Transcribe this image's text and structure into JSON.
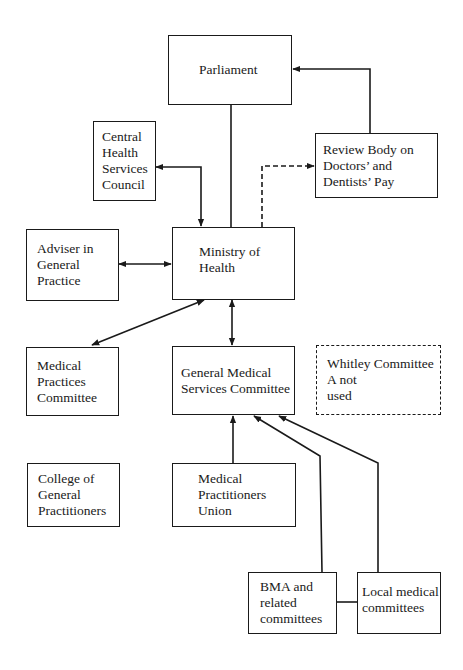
{
  "nodes": {
    "parliament": {
      "lines": [
        "Parliament"
      ]
    },
    "central_health_services_council": {
      "lines": [
        "Central",
        "Health",
        "Services",
        "Council"
      ]
    },
    "review_body": {
      "lines": [
        "Review Body on",
        "Doctors’ and",
        "Dentists’ Pay"
      ]
    },
    "adviser_general_practice": {
      "lines": [
        "Adviser in",
        "General",
        "Practice"
      ]
    },
    "ministry_of_health": {
      "lines": [
        "Ministry of",
        "Health"
      ]
    },
    "medical_practices_committee": {
      "lines": [
        "Medical",
        "Practices",
        "Committee"
      ]
    },
    "gmsc": {
      "lines": [
        "General Medical",
        "Services Committee"
      ]
    },
    "whitley_committee": {
      "lines": [
        "Whitley Committee",
        "A not",
        "used"
      ]
    },
    "college_gp": {
      "lines": [
        "College of",
        "General",
        "Practitioners"
      ]
    },
    "mpu": {
      "lines": [
        "Medical",
        "Practitioners",
        "Union"
      ]
    },
    "bma": {
      "lines": [
        "BMA and",
        "related",
        "committees"
      ]
    },
    "local_medical_committees": {
      "lines": [
        "Local medical",
        "committees"
      ]
    }
  },
  "colors": {
    "line": "#1a1a1a",
    "background": "#ffffff"
  }
}
